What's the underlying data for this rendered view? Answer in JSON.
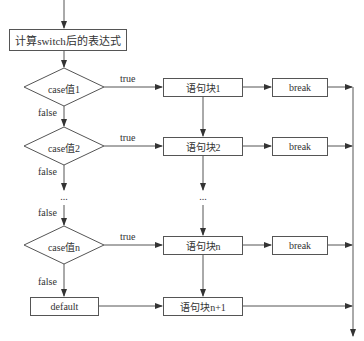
{
  "diagram": {
    "type": "flowchart",
    "title_box": "计算switch后的表达式",
    "conditions": [
      {
        "label": "case值1",
        "true_label": "true",
        "false_label": "false"
      },
      {
        "label": "case值2",
        "true_label": "true",
        "false_label": "false"
      },
      {
        "label": "case值n",
        "true_label": "true",
        "false_label": "false"
      }
    ],
    "ellipsis_left": "...",
    "ellipsis_right": "...",
    "false_between": "false",
    "default_label": "default",
    "blocks": [
      "语句块1",
      "语句块2",
      "语句块n",
      "语句块n+1"
    ],
    "break_label": "break",
    "line_color": "#555555"
  }
}
